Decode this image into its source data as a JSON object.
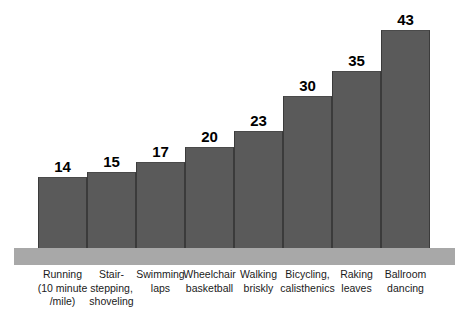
{
  "chart_data": {
    "type": "bar",
    "title": "",
    "subtitle": "",
    "xlabel": "",
    "ylabel": "",
    "ylim": [
      0,
      43
    ],
    "grid": false,
    "legend": false,
    "categories": [
      "Running (10 minute /mile)",
      "Stair-stepping, shoveling",
      "Swimming laps",
      "Wheelchair basketball",
      "Walking briskly",
      "Bicycling, calisthenics",
      "Raking leaves",
      "Ballroom dancing"
    ],
    "category_lines": [
      [
        "Running",
        "(10 minute",
        "/mile)"
      ],
      [
        "Stair-",
        "stepping,",
        "shoveling"
      ],
      [
        "Swimming",
        "laps"
      ],
      [
        "Wheelchair",
        "basketball"
      ],
      [
        "Walking",
        "briskly"
      ],
      [
        "Bicycling,",
        "calisthenics"
      ],
      [
        "Raking",
        "leaves"
      ],
      [
        "Ballroom",
        "dancing"
      ]
    ],
    "values": [
      14,
      15,
      17,
      20,
      23,
      30,
      35,
      43
    ],
    "value_labels": [
      "14",
      "15",
      "17",
      "20",
      "23",
      "30",
      "35",
      "43"
    ]
  },
  "style": {
    "background": "#ffffff",
    "bar_fill": "#5a5a5a",
    "bar_edge": "#3b3b3b",
    "plinth_fill": "#a8a8a8",
    "value_text": "#000000",
    "label_text": "#1a1a1a"
  }
}
